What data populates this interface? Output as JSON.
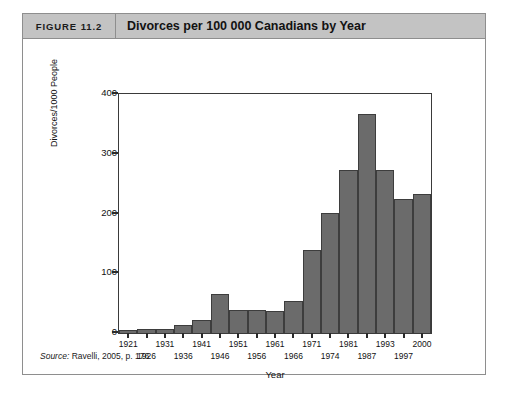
{
  "figure": {
    "number_label": "FIGURE 11.2",
    "title": "Divorces per 100 000 Canadians by Year",
    "source_prefix": "Source:",
    "source_text": "Ravelli, 2005, p. 176"
  },
  "chart_data": {
    "type": "bar",
    "title": "Divorces per 100 000 Canadians by Year",
    "xlabel": "Year",
    "ylabel": "Divorces/1000 People",
    "categories": [
      "1921",
      "1926",
      "1931",
      "1936",
      "1941",
      "1946",
      "1951",
      "1956",
      "1961",
      "1966",
      "1971",
      "1974",
      "1981",
      "1987",
      "1993",
      "1997",
      "2000"
    ],
    "values": [
      5,
      6,
      7,
      14,
      22,
      65,
      38,
      38,
      37,
      53,
      139,
      201,
      272,
      367,
      272,
      224,
      232
    ],
    "ylim": [
      0,
      400
    ],
    "yticks": [
      0,
      100,
      200,
      300,
      400
    ],
    "ytick_labels": [
      "0",
      "100",
      "200",
      "300",
      "400"
    ],
    "grid": false,
    "legend": false,
    "bar_color": "#6b6b6b",
    "bar_edge_color": "#3d3d3d"
  }
}
